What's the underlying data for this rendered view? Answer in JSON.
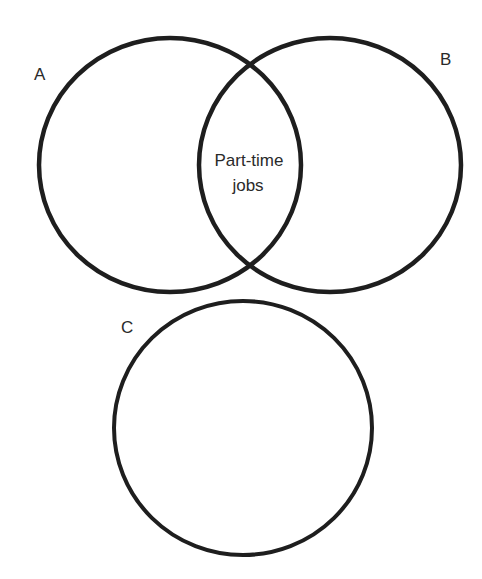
{
  "diagram": {
    "type": "venn",
    "stroke_color": "#1e1e1e",
    "sets": [
      {
        "id": "A",
        "label": "A"
      },
      {
        "id": "B",
        "label": "B"
      },
      {
        "id": "C",
        "label": "C"
      }
    ],
    "intersections": [
      {
        "sets": [
          "A",
          "B"
        ],
        "label_line1": "Part-time",
        "label_line2": "jobs"
      }
    ]
  }
}
